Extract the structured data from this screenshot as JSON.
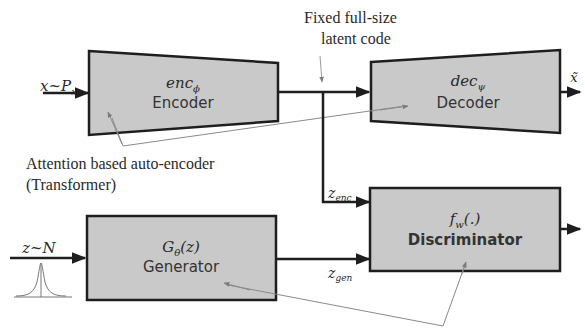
{
  "colors": {
    "box_fill": "#c9c9c9",
    "box_stroke": "#1e1e1e",
    "line": "#1e1e1e",
    "annotation_line": "#8a8a8a",
    "background": "#ffffff"
  },
  "annotations": {
    "latent_code_line1": "Fixed full-size",
    "latent_code_line2": "latent code",
    "autoencoder_line1": "Attention based auto-encoder",
    "autoencoder_line2": "(Transformer)"
  },
  "encoder": {
    "symbol_base": "enc",
    "symbol_sub": "ϕ",
    "name": "Encoder"
  },
  "decoder": {
    "symbol_base": "dec",
    "symbol_sub": "ψ",
    "name": "Decoder"
  },
  "generator": {
    "symbol_base": "G",
    "symbol_sub": "θ",
    "symbol_arg": "(z)",
    "name": "Generator"
  },
  "discriminator": {
    "symbol_base": "f",
    "symbol_sub": "w",
    "symbol_arg": "(.)",
    "name": "Discriminator"
  },
  "signals": {
    "input_x": "x~P",
    "input_x_sub": "x",
    "output_x": "x̃",
    "input_z": "z~N",
    "z_enc_base": "z",
    "z_enc_sub": "enc",
    "z_gen_base": "z",
    "z_gen_sub": "gen"
  },
  "icons": {
    "gaussian": "gaussian-distribution-icon"
  }
}
